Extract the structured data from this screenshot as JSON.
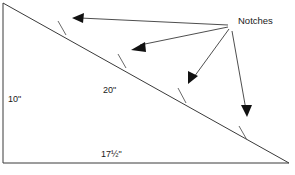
{
  "diagram": {
    "background_color": "#ffffff",
    "line_color": "#3a3a3a",
    "notch_color": "#6a6a6a",
    "arrow_color": "#111111",
    "text_color": "#1a1a1a"
  },
  "shape": {
    "name": "right-triangle",
    "vertices": [
      {
        "name": "top-left-apex",
        "x": 3,
        "y": 3
      },
      {
        "name": "bottom-left-corner",
        "x": 3,
        "y": 163
      },
      {
        "name": "bottom-right-corner",
        "x": 289,
        "y": 163
      }
    ],
    "edges": [
      {
        "name": "vertical-side",
        "label": "10\""
      },
      {
        "name": "bottom-side",
        "label": "17½\""
      },
      {
        "name": "hypotenuse",
        "label": "20\""
      }
    ]
  },
  "labels": {
    "vertical_side": "10\"",
    "hypotenuse": "20\"",
    "bottom_side": "17½\"",
    "callout": "Notches"
  },
  "label_positions": {
    "vertical_side": {
      "x": 8,
      "y": 102
    },
    "hypotenuse": {
      "x": 103,
      "y": 93
    },
    "bottom_side": {
      "x": 101,
      "y": 157
    },
    "callout": {
      "x": 238,
      "y": 24
    }
  },
  "callout": {
    "text": "Notches",
    "origin": {
      "x": 228,
      "y": 25
    },
    "count": 4
  },
  "notches": [
    {
      "name": "notch-1",
      "tick": {
        "x1": 58,
        "y1": 21,
        "x2": 66,
        "y2": 35
      },
      "arrow_tip": {
        "x": 72,
        "y": 18
      },
      "leader_from": {
        "x": 228,
        "y": 25
      }
    },
    {
      "name": "notch-2",
      "tick": {
        "x1": 118,
        "y1": 54,
        "x2": 126,
        "y2": 68
      },
      "arrow_tip": {
        "x": 131,
        "y": 50
      },
      "leader_from": {
        "x": 228,
        "y": 27
      }
    },
    {
      "name": "notch-3",
      "tick": {
        "x1": 178,
        "y1": 88,
        "x2": 186,
        "y2": 103
      },
      "arrow_tip": {
        "x": 188,
        "y": 84
      },
      "leader_from": {
        "x": 229,
        "y": 29
      }
    },
    {
      "name": "notch-4",
      "tick": {
        "x1": 239,
        "y1": 126,
        "x2": 247,
        "y2": 140
      },
      "arrow_tip": {
        "x": 247,
        "y": 117
      },
      "leader_from": {
        "x": 232,
        "y": 31
      }
    }
  ]
}
